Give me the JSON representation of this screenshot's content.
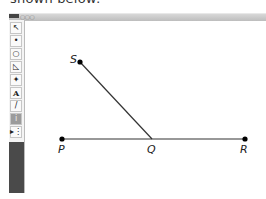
{
  "caption": "shown below:",
  "window": {
    "title_dots": "○○○"
  },
  "toolbar": {
    "tools": [
      {
        "name": "arrow-tool",
        "glyph": "↖"
      },
      {
        "name": "point-tool",
        "glyph": "•"
      },
      {
        "name": "compass-tool",
        "glyph": "○"
      },
      {
        "name": "straightedge-tool",
        "glyph": "◺"
      },
      {
        "name": "marker-tool",
        "glyph": "✦"
      },
      {
        "name": "text-tool",
        "glyph": "A"
      },
      {
        "name": "pencil-tool",
        "glyph": "/"
      },
      {
        "name": "info-tool",
        "glyph": "i"
      },
      {
        "name": "custom-tool",
        "glyph": "▸⋮"
      }
    ]
  },
  "figure": {
    "points": [
      {
        "label": "S",
        "x": 80,
        "y": 62
      },
      {
        "label": "P",
        "x": 62,
        "y": 139
      },
      {
        "label": "Q",
        "x": 152,
        "y": 139
      },
      {
        "label": "R",
        "x": 245,
        "y": 139
      }
    ],
    "segments": [
      {
        "from": "P",
        "to": "R"
      },
      {
        "from": "S",
        "to": "Q"
      }
    ],
    "labels": {
      "S": "S",
      "P": "P",
      "Q": "Q",
      "R": "R"
    }
  }
}
